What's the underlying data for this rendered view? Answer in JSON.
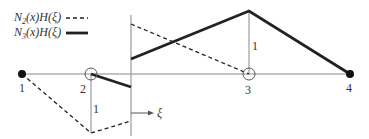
{
  "legend": [
    {
      "label_N": "N",
      "label_sub": "2",
      "label_rest": "(x)H(ξ)",
      "style": "dashed"
    },
    {
      "label_N": "N",
      "label_sub": "3",
      "label_rest": "(x)H(ξ)",
      "style": "solid"
    }
  ],
  "nodes": [
    {
      "id": "1",
      "type": "filled"
    },
    {
      "id": "2",
      "type": "open"
    },
    {
      "id": "3",
      "type": "open"
    },
    {
      "id": "4",
      "type": "filled"
    }
  ],
  "annotations": {
    "height_label_node2": "1",
    "height_label_node3": "1",
    "xi_label": "ξ"
  },
  "colors": {
    "axis": "#888888",
    "curve": "#222222"
  }
}
